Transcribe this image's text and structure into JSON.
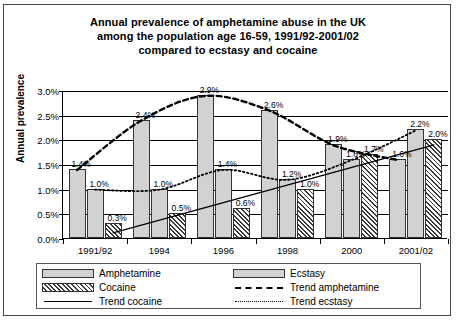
{
  "chart_data": {
    "type": "bar",
    "title": "Annual prevalence of amphetamine abuse in the UK among the population age 16-59, 1991/92-2001/02 compared to ecstasy and cocaine",
    "title_lines": [
      "Annual prevalence of amphetamine abuse in the UK",
      "among the population age 16-59, 1991/92-2001/02",
      "compared to ecstasy and cocaine"
    ],
    "xlabel": "",
    "ylabel": "Annual prevalence",
    "categories": [
      "1991/92",
      "1994",
      "1996",
      "1998",
      "2000",
      "2001/02"
    ],
    "ylim": [
      0,
      3.0
    ],
    "ytick_labels": [
      "0.0%",
      "0.5%",
      "1.0%",
      "1.5%",
      "2.0%",
      "2.5%",
      "3.0%"
    ],
    "ytick_values": [
      0,
      0.5,
      1.0,
      1.5,
      2.0,
      2.5,
      3.0
    ],
    "grid": true,
    "legend_position": "bottom",
    "series": [
      {
        "name": "Amphetamine",
        "style": "bar-grey",
        "values": [
          1.4,
          2.4,
          2.9,
          2.6,
          1.9,
          1.6
        ],
        "labels": [
          "1.4%",
          "2.4%",
          "2.9%",
          "2.6%",
          "1.9%",
          "1.6%"
        ]
      },
      {
        "name": "Ecstasy",
        "style": "bar-grey",
        "values": [
          1.0,
          1.0,
          1.4,
          1.2,
          1.6,
          2.2
        ],
        "labels": [
          "1.0%",
          "1.0%",
          "1.4%",
          "1.2%",
          "1.6%",
          "2.2%"
        ]
      },
      {
        "name": "Cocaine",
        "style": "bar-hatch",
        "values": [
          0.3,
          0.5,
          0.6,
          1.0,
          1.7,
          2.0
        ],
        "labels": [
          "0.3%",
          "0.5%",
          "0.6%",
          "1.0%",
          "1.7%",
          "2.0%"
        ]
      },
      {
        "name": "Trend amphetamine",
        "style": "line-dashed",
        "values": [
          1.4,
          2.4,
          2.9,
          2.6,
          1.9,
          1.6
        ]
      },
      {
        "name": "Trend cocaine",
        "style": "line-solid",
        "values": [
          0.3,
          0.5,
          0.6,
          1.0,
          1.7,
          2.0
        ]
      },
      {
        "name": "Trend ecstasy",
        "style": "line-dotted",
        "values": [
          1.0,
          1.0,
          1.4,
          1.2,
          1.6,
          2.2
        ]
      }
    ],
    "legend": [
      {
        "label": "Amphetamine",
        "key": "swatch-grey"
      },
      {
        "label": "Ecstasy",
        "key": "swatch-grey"
      },
      {
        "label": "Cocaine",
        "key": "swatch-hatch"
      },
      {
        "label": "Trend amphetamine",
        "key": "line-dashed"
      },
      {
        "label": "Trend cocaine",
        "key": "line-solid"
      },
      {
        "label": "Trend ecstasy",
        "key": "line-dotted"
      }
    ],
    "colors": {
      "bar_fill": "#d2d2d2",
      "bar_border": "#333333",
      "hatch": "#3a3a3a",
      "axis": "#000000",
      "background": "#ffffff"
    }
  }
}
